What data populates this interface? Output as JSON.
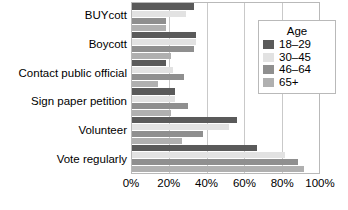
{
  "chart_data": {
    "type": "bar",
    "orientation": "horizontal",
    "title": "",
    "xlabel": "",
    "ylabel": "",
    "grid": true,
    "xlim": [
      0,
      100
    ],
    "xticks": [
      0,
      20,
      40,
      60,
      80,
      100
    ],
    "xtick_labels": [
      "0%",
      "20%",
      "40%",
      "60%",
      "80%",
      "100%"
    ],
    "categories": [
      "BUYcott",
      "Boycott",
      "Contact public official",
      "Sign paper petition",
      "Volunteer",
      "Vote regularly"
    ],
    "legend_title": "Age",
    "legend_position": "right",
    "series": [
      {
        "name": "18–29",
        "color": "#5a5a5a",
        "values": [
          33,
          34,
          18,
          23,
          56,
          67
        ]
      },
      {
        "name": "30–45",
        "color": "#e2e2e2",
        "values": [
          29,
          34,
          22,
          23,
          52,
          82
        ]
      },
      {
        "name": "46–64",
        "color": "#8f8f8f",
        "values": [
          18,
          33,
          28,
          30,
          38,
          89
        ]
      },
      {
        "name": "65+",
        "color": "#b0b0b0",
        "values": [
          18,
          21,
          14,
          21,
          27,
          92
        ]
      }
    ]
  },
  "axis": {
    "tick_0": "0%",
    "tick_20": "20%",
    "tick_40": "40%",
    "tick_60": "60%",
    "tick_80": "80%",
    "tick_100": "100%"
  },
  "legend": {
    "title": "Age",
    "items": [
      {
        "label": "18–29",
        "color": "#5a5a5a"
      },
      {
        "label": "30–45",
        "color": "#e2e2e2"
      },
      {
        "label": "46–64",
        "color": "#8f8f8f"
      },
      {
        "label": "65+",
        "color": "#b0b0b0"
      }
    ]
  }
}
